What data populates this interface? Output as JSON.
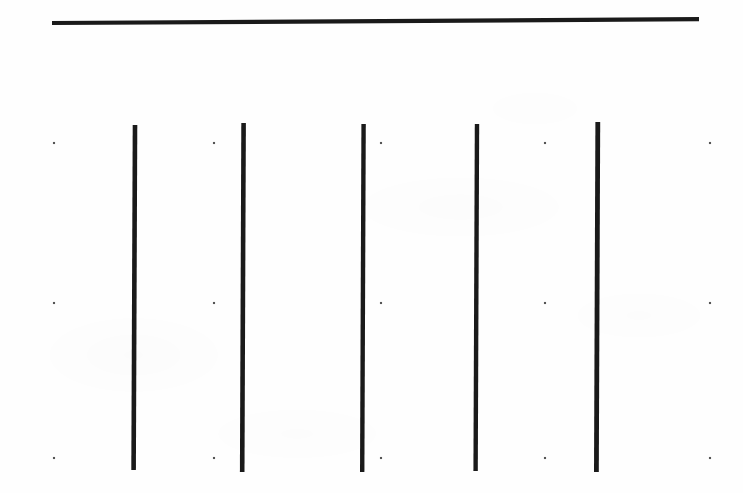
{
  "figure": {
    "canvas": {
      "width": 743,
      "height": 493
    },
    "background_color": "#fefefe",
    "ink_color": "#1a1a1a",
    "dot_color": "#555555"
  },
  "chart_data": {
    "type": "line",
    "title": "",
    "subtitle": "",
    "xlabel": "",
    "ylabel": "",
    "grid": false,
    "legend_position": "none",
    "xlim": [
      0,
      743
    ],
    "ylim": [
      0,
      493
    ],
    "annotations": [],
    "tick_labels": {
      "x": [],
      "y": []
    },
    "series": [
      {
        "name": "horizontal-rule",
        "orientation": "horizontal",
        "stroke_width": 4.2,
        "points": [
          {
            "x": 52,
            "y": 23.0
          },
          {
            "x": 699,
            "y": 19.2
          }
        ]
      },
      {
        "name": "vertical-stroke-1",
        "orientation": "vertical",
        "stroke_width": 4.6,
        "points": [
          {
            "x": 135.0,
            "y": 125.0
          },
          {
            "x": 133.6,
            "y": 470.0
          }
        ]
      },
      {
        "name": "vertical-stroke-2",
        "orientation": "vertical",
        "stroke_width": 4.6,
        "points": [
          {
            "x": 243.6,
            "y": 123.0
          },
          {
            "x": 242.2,
            "y": 472.0
          }
        ]
      },
      {
        "name": "vertical-stroke-3",
        "orientation": "vertical",
        "stroke_width": 4.4,
        "points": [
          {
            "x": 363.6,
            "y": 124.0
          },
          {
            "x": 362.2,
            "y": 472.0
          }
        ]
      },
      {
        "name": "vertical-stroke-4",
        "orientation": "vertical",
        "stroke_width": 4.4,
        "points": [
          {
            "x": 477.0,
            "y": 124.0
          },
          {
            "x": 475.6,
            "y": 471.0
          }
        ]
      },
      {
        "name": "vertical-stroke-5",
        "orientation": "vertical",
        "stroke_width": 4.8,
        "points": [
          {
            "x": 597.8,
            "y": 122.0
          },
          {
            "x": 596.4,
            "y": 472.0
          }
        ]
      }
    ],
    "markers": {
      "name": "registration-dots",
      "size": 2.1,
      "columns_x": [
        54,
        214,
        381,
        545,
        710
      ],
      "rows_y": [
        143,
        303,
        458
      ],
      "points": [
        {
          "x": 54,
          "y": 143
        },
        {
          "x": 214,
          "y": 143
        },
        {
          "x": 381,
          "y": 143
        },
        {
          "x": 545,
          "y": 143
        },
        {
          "x": 710,
          "y": 143
        },
        {
          "x": 54,
          "y": 303
        },
        {
          "x": 214,
          "y": 303
        },
        {
          "x": 381,
          "y": 303
        },
        {
          "x": 545,
          "y": 303
        },
        {
          "x": 710,
          "y": 303
        },
        {
          "x": 54,
          "y": 458
        },
        {
          "x": 214,
          "y": 458
        },
        {
          "x": 381,
          "y": 458
        },
        {
          "x": 545,
          "y": 458
        },
        {
          "x": 710,
          "y": 458
        }
      ]
    }
  }
}
